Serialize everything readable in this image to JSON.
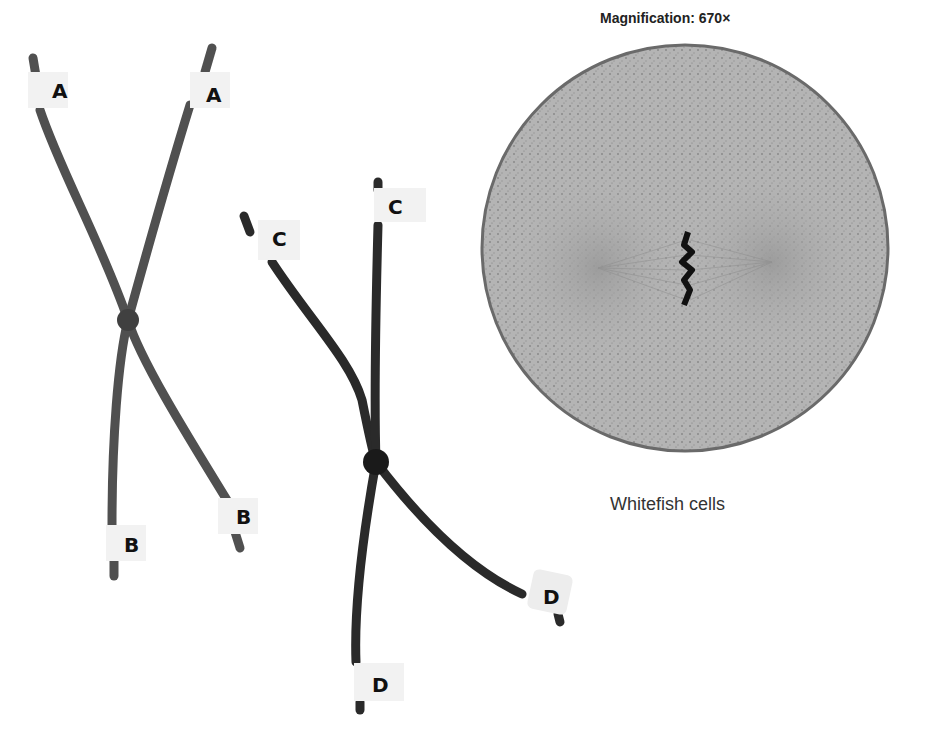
{
  "figure": {
    "magnification_label": "Magnification: 670×",
    "caption": "Whitefish cells"
  },
  "chromosome_models": [
    {
      "name": "chromosome-ab",
      "labels": {
        "top_left": "A",
        "top_right": "A",
        "bottom_left": "B",
        "bottom_right": "B"
      },
      "color": "#505050"
    },
    {
      "name": "chromosome-cd",
      "labels": {
        "top_left": "C",
        "top_right": "C",
        "bottom_left": "D",
        "bottom_right": "D"
      },
      "color": "#2a2a2a"
    }
  ],
  "micrograph": {
    "description": "Metaphase cell with spindle fibers and chromosomes aligned at equator",
    "fill": "#b0b0b0",
    "border": "#6a6a6a"
  }
}
